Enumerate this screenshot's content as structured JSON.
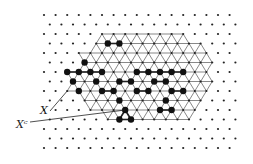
{
  "figure": {
    "labels": [
      {
        "id": "x",
        "text": "X"
      },
      {
        "id": "xc",
        "text": "Xᶜ"
      }
    ],
    "colors": {
      "ink": "#222222",
      "background": "#ffffff"
    },
    "lattice": {
      "rows": 15,
      "cols": 17
    },
    "region_X_cells": [
      [
        2,
        5
      ],
      [
        2,
        6
      ],
      [
        2,
        7
      ],
      [
        2,
        8
      ],
      [
        2,
        9
      ],
      [
        2,
        10
      ],
      [
        2,
        11
      ],
      [
        2,
        12
      ],
      [
        3,
        4
      ],
      [
        3,
        5
      ],
      [
        3,
        6
      ],
      [
        3,
        7
      ],
      [
        3,
        8
      ],
      [
        3,
        9
      ],
      [
        3,
        10
      ],
      [
        3,
        11
      ],
      [
        3,
        12
      ],
      [
        3,
        13
      ],
      [
        4,
        3
      ],
      [
        4,
        4
      ],
      [
        4,
        5
      ],
      [
        4,
        6
      ],
      [
        4,
        7
      ],
      [
        4,
        8
      ],
      [
        4,
        9
      ],
      [
        4,
        10
      ],
      [
        4,
        11
      ],
      [
        4,
        12
      ],
      [
        4,
        13
      ],
      [
        4,
        14
      ],
      [
        5,
        3
      ],
      [
        5,
        4
      ],
      [
        5,
        5
      ],
      [
        5,
        6
      ],
      [
        5,
        7
      ],
      [
        5,
        8
      ],
      [
        5,
        9
      ],
      [
        5,
        10
      ],
      [
        5,
        11
      ],
      [
        5,
        12
      ],
      [
        5,
        13
      ],
      [
        5,
        14
      ],
      [
        6,
        2
      ],
      [
        6,
        3
      ],
      [
        6,
        4
      ],
      [
        6,
        5
      ],
      [
        6,
        6
      ],
      [
        6,
        7
      ],
      [
        6,
        8
      ],
      [
        6,
        9
      ],
      [
        6,
        10
      ],
      [
        6,
        11
      ],
      [
        6,
        12
      ],
      [
        6,
        13
      ],
      [
        6,
        14
      ],
      [
        7,
        2
      ],
      [
        7,
        3
      ],
      [
        7,
        4
      ],
      [
        7,
        5
      ],
      [
        7,
        6
      ],
      [
        7,
        7
      ],
      [
        7,
        8
      ],
      [
        7,
        9
      ],
      [
        7,
        10
      ],
      [
        7,
        11
      ],
      [
        7,
        12
      ],
      [
        7,
        13
      ],
      [
        7,
        14
      ],
      [
        8,
        2
      ],
      [
        8,
        3
      ],
      [
        8,
        4
      ],
      [
        8,
        5
      ],
      [
        8,
        6
      ],
      [
        8,
        7
      ],
      [
        8,
        8
      ],
      [
        8,
        9
      ],
      [
        8,
        10
      ],
      [
        8,
        11
      ],
      [
        8,
        12
      ],
      [
        8,
        13
      ],
      [
        8,
        14
      ],
      [
        9,
        3
      ],
      [
        9,
        4
      ],
      [
        9,
        5
      ],
      [
        9,
        6
      ],
      [
        9,
        7
      ],
      [
        9,
        8
      ],
      [
        9,
        9
      ],
      [
        9,
        10
      ],
      [
        9,
        11
      ],
      [
        9,
        12
      ],
      [
        9,
        13
      ],
      [
        10,
        4
      ],
      [
        10,
        5
      ],
      [
        10,
        6
      ],
      [
        10,
        7
      ],
      [
        10,
        8
      ],
      [
        10,
        9
      ],
      [
        10,
        10
      ],
      [
        10,
        11
      ],
      [
        10,
        12
      ],
      [
        10,
        13
      ],
      [
        11,
        5
      ],
      [
        11,
        6
      ],
      [
        11,
        7
      ],
      [
        11,
        8
      ],
      [
        11,
        9
      ],
      [
        11,
        10
      ],
      [
        11,
        11
      ],
      [
        11,
        12
      ]
    ],
    "black_dots": [
      [
        3,
        5
      ],
      [
        3,
        6
      ],
      [
        5,
        3
      ],
      [
        6,
        2
      ],
      [
        6,
        3
      ],
      [
        6,
        4
      ],
      [
        6,
        5
      ],
      [
        6,
        8
      ],
      [
        6,
        9
      ],
      [
        6,
        10
      ],
      [
        6,
        11
      ],
      [
        6,
        12
      ],
      [
        7,
        2
      ],
      [
        7,
        4
      ],
      [
        7,
        6
      ],
      [
        7,
        7
      ],
      [
        7,
        9
      ],
      [
        7,
        10
      ],
      [
        8,
        3
      ],
      [
        8,
        5
      ],
      [
        8,
        6
      ],
      [
        8,
        8
      ],
      [
        8,
        9
      ],
      [
        8,
        11
      ],
      [
        8,
        12
      ],
      [
        9,
        6
      ],
      [
        9,
        10
      ],
      [
        10,
        7
      ],
      [
        10,
        10
      ],
      [
        10,
        11
      ],
      [
        11,
        6
      ],
      [
        11,
        7
      ]
    ],
    "black_edges": [
      [
        [
          3,
          5
        ],
        [
          3,
          6
        ]
      ],
      [
        [
          6,
          2
        ],
        [
          6,
          3
        ]
      ],
      [
        [
          6,
          3
        ],
        [
          6,
          4
        ]
      ],
      [
        [
          6,
          4
        ],
        [
          6,
          5
        ]
      ],
      [
        [
          6,
          8
        ],
        [
          6,
          9
        ]
      ],
      [
        [
          6,
          9
        ],
        [
          6,
          10
        ]
      ],
      [
        [
          6,
          10
        ],
        [
          6,
          11
        ]
      ],
      [
        [
          6,
          11
        ],
        [
          6,
          12
        ]
      ],
      [
        [
          7,
          6
        ],
        [
          7,
          7
        ]
      ],
      [
        [
          7,
          9
        ],
        [
          7,
          10
        ]
      ],
      [
        [
          8,
          5
        ],
        [
          8,
          6
        ]
      ],
      [
        [
          8,
          8
        ],
        [
          8,
          9
        ]
      ],
      [
        [
          8,
          11
        ],
        [
          8,
          12
        ]
      ],
      [
        [
          10,
          10
        ],
        [
          10,
          11
        ]
      ],
      [
        [
          11,
          6
        ],
        [
          11,
          7
        ]
      ],
      [
        [
          10,
          7
        ],
        [
          11,
          7
        ]
      ],
      [
        [
          10,
          7
        ],
        [
          11,
          6
        ]
      ]
    ]
  }
}
